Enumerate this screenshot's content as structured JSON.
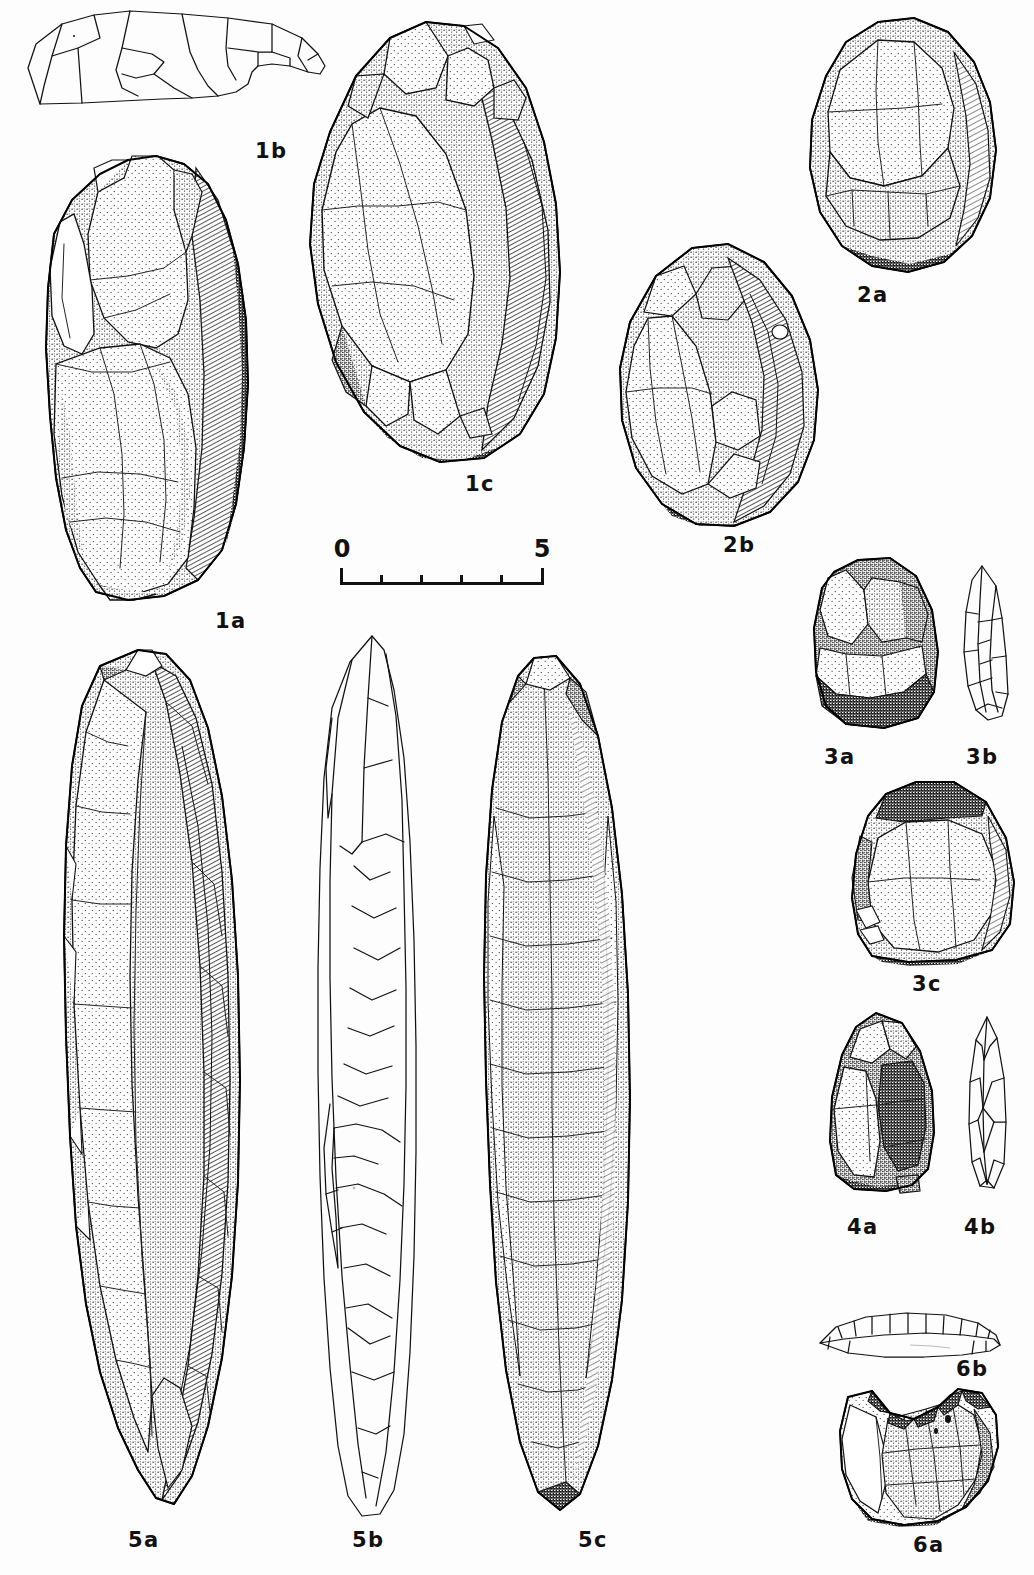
{
  "plate": {
    "kind": "archaeological-lithic-illustration-plate",
    "background_color": "#fdfdfd",
    "ink_color": "#111111",
    "width": 1034,
    "height": 1575
  },
  "scale_bar": {
    "name": "scale-bar",
    "start_label": "0",
    "end_label": "5",
    "unit_divisions": 5,
    "tick_labels": [
      "0",
      "",
      "",
      "",
      "",
      "5"
    ],
    "x": 340,
    "y": 553,
    "width": 204,
    "height": 32
  },
  "figures": [
    {
      "id": "1b",
      "label": "1b",
      "style": "line-drawing",
      "description": "outline section view of cobble tool",
      "x": 22,
      "y": 8,
      "width": 312,
      "height": 130,
      "label_x": 255,
      "label_y": 139
    },
    {
      "id": "1a",
      "label": "1a",
      "style": "stipple-shaded",
      "description": "large unifacial cobble chopper, dorsal view",
      "x": 36,
      "y": 148,
      "width": 232,
      "height": 455,
      "label_x": 215,
      "label_y": 609
    },
    {
      "id": "1c",
      "label": "1c",
      "style": "stipple-shaded",
      "description": "large cobble core tool, ventral view",
      "x": 288,
      "y": 14,
      "width": 292,
      "height": 455,
      "label_x": 465,
      "label_y": 472
    },
    {
      "id": "2a",
      "label": "2a",
      "style": "stipple-shaded",
      "description": "flaked cobble, dorsal view",
      "x": 792,
      "y": 10,
      "width": 222,
      "height": 265,
      "label_x": 857,
      "label_y": 283
    },
    {
      "id": "2b",
      "label": "2b",
      "style": "stipple-shaded",
      "description": "flaked cobble, ventral view",
      "x": 600,
      "y": 236,
      "width": 235,
      "height": 295,
      "label_x": 723,
      "label_y": 533
    },
    {
      "id": "3a",
      "label": "3a",
      "style": "stipple-shaded",
      "description": "retouched flake, dorsal view",
      "x": 806,
      "y": 548,
      "width": 140,
      "height": 185,
      "label_x": 824,
      "label_y": 745
    },
    {
      "id": "3b",
      "label": "3b",
      "style": "line-drawing",
      "description": "retouched flake, edge profile",
      "x": 952,
      "y": 560,
      "width": 62,
      "height": 170,
      "label_x": 966,
      "label_y": 745
    },
    {
      "id": "3c",
      "label": "3c",
      "style": "stipple-shaded",
      "description": "side scraper on flake, dorsal view",
      "x": 838,
      "y": 772,
      "width": 182,
      "height": 195,
      "label_x": 912,
      "label_y": 972
    },
    {
      "id": "4a",
      "label": "4a",
      "style": "stipple-shaded",
      "description": "bifacially worked point, face view",
      "x": 820,
      "y": 1005,
      "width": 128,
      "height": 190,
      "label_x": 847,
      "label_y": 1215
    },
    {
      "id": "4b",
      "label": "4b",
      "style": "line-drawing",
      "description": "bifacially worked point, edge profile",
      "x": 962,
      "y": 1012,
      "width": 50,
      "height": 183,
      "label_x": 964,
      "label_y": 1215
    },
    {
      "id": "5a",
      "label": "5a",
      "style": "stipple-shaded",
      "description": "elongated biface / pick, dorsal view",
      "x": 42,
      "y": 636,
      "width": 218,
      "height": 880,
      "label_x": 128,
      "label_y": 1528
    },
    {
      "id": "5b",
      "label": "5b",
      "style": "line-drawing",
      "description": "elongated biface / pick, edge profile",
      "x": 300,
      "y": 628,
      "width": 138,
      "height": 895,
      "label_x": 352,
      "label_y": 1528
    },
    {
      "id": "5c",
      "label": "5c",
      "style": "stipple-shaded",
      "description": "elongated biface / pick, ventral view",
      "x": 470,
      "y": 636,
      "width": 180,
      "height": 880,
      "label_x": 578,
      "label_y": 1528
    },
    {
      "id": "6b",
      "label": "6b",
      "style": "line-drawing",
      "description": "notched flake, thin edge section",
      "x": 814,
      "y": 1305,
      "width": 190,
      "height": 62,
      "label_x": 956,
      "label_y": 1357
    },
    {
      "id": "6a",
      "label": "6a",
      "style": "stipple-shaded",
      "description": "notched flake, dorsal view",
      "x": 830,
      "y": 1375,
      "width": 180,
      "height": 152,
      "label_x": 913,
      "label_y": 1533
    }
  ]
}
